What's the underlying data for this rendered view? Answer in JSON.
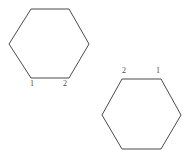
{
  "figure": {
    "background_color": "#ffffff",
    "stroke_color": "#4a4a50",
    "label_color": "#4a4a50",
    "canvas": {
      "width": 194,
      "height": 161
    },
    "shapes": [
      {
        "id": "hexagon-upper-left",
        "name": "hexagon",
        "sides": 6,
        "points": "31,9 69,9 89,44 69,78 31,78 9,44",
        "vertex_labels": [
          {
            "text": "1",
            "x": 30,
            "y": 80,
            "position": "below-left"
          },
          {
            "text": "2",
            "x": 63,
            "y": 80,
            "position": "below-right"
          }
        ]
      },
      {
        "id": "hexagon-lower-right",
        "name": "hexagon",
        "sides": 6,
        "points": "122,79 161,79 181,115 161,149 122,149 102,115",
        "vertex_labels": [
          {
            "text": "2",
            "x": 122,
            "y": 67,
            "position": "above-left"
          },
          {
            "text": "1",
            "x": 156,
            "y": 67,
            "position": "above-right"
          }
        ]
      }
    ]
  }
}
